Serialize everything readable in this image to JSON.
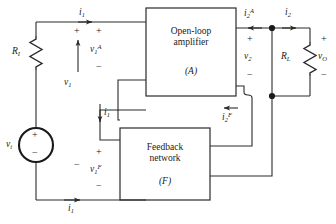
{
  "diagram": {
    "type": "circuit-schematic",
    "line_color": "#2a2a2a",
    "background": "#ffffff"
  },
  "blocks": {
    "amplifier": {
      "name": "open-loop-amplifier",
      "line1": "Open-loop",
      "line2": "amplifier",
      "symbol": "(A)"
    },
    "feedback": {
      "name": "feedback-network",
      "line1": "Feedback",
      "line2": "network",
      "symbol": "(F)"
    }
  },
  "components": {
    "source": {
      "label": "v",
      "sub": "i",
      "plus": "+",
      "minus": "−"
    },
    "input_resistor": {
      "label": "R",
      "sub": "I"
    },
    "load_resistor": {
      "label": "R",
      "sub": "L"
    }
  },
  "labels": {
    "i1_top": {
      "base": "i",
      "sub": "1"
    },
    "i1_mid": {
      "base": "i",
      "sub": "1"
    },
    "i1_bottom": {
      "base": "i",
      "sub": "1"
    },
    "i2A": {
      "base": "i",
      "sub": "2",
      "sup": "A"
    },
    "i2F": {
      "base": "i",
      "sub": "2",
      "sup": "F"
    },
    "i2": {
      "base": "i",
      "sub": "2"
    },
    "v1": {
      "base": "v",
      "sub": "1"
    },
    "v1A": {
      "base": "v",
      "sub": "1",
      "sup": "A"
    },
    "v1F": {
      "base": "v",
      "sub": "1",
      "sup": "F"
    },
    "v2": {
      "base": "v",
      "sub": "2"
    },
    "vO": {
      "base": "v",
      "sub": "O"
    }
  },
  "polarity": {
    "v1_plus": "+",
    "v1_minus": "−",
    "v1A_plus": "+",
    "v1A_minus": "−",
    "v1F_plus": "+",
    "v1F_minus": "−",
    "v2_plus": "+",
    "v2_minus": "−",
    "vO_plus": "+",
    "vO_minus": "−"
  }
}
